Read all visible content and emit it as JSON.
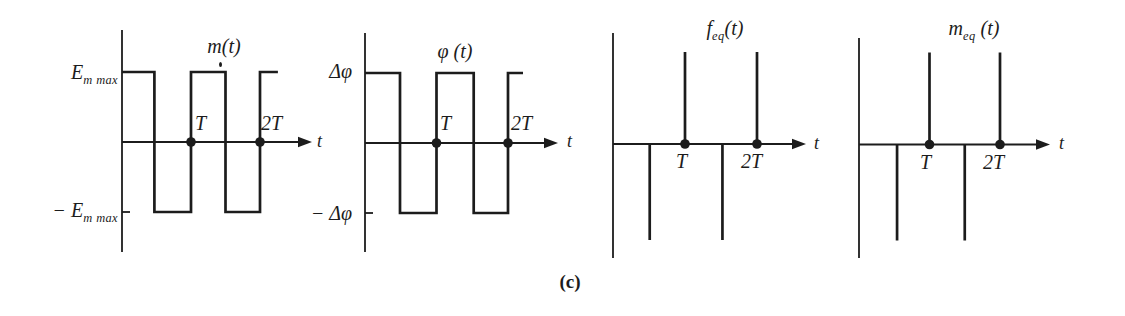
{
  "colors": {
    "ink": "#1c1c1c",
    "paper": "#ffffff"
  },
  "figure": {
    "caption": "(c)"
  },
  "chart_data": [
    {
      "id": "m-plot",
      "type": "line",
      "waveform": "square",
      "title": {
        "pre": "m",
        "sub": "",
        "post": "(t)"
      },
      "xlabel": "t",
      "y_high_label": {
        "pre": "E",
        "sub": "m max",
        "post": ""
      },
      "y_low_label": {
        "pre": "− E",
        "sub": "m max",
        "post": ""
      },
      "x_ticks": [
        "T",
        "2T"
      ],
      "x_in_T": [
        0,
        0.47,
        0.47,
        1,
        1,
        1.5,
        1.5,
        2,
        2,
        2.26
      ],
      "y": [
        1,
        1,
        -1,
        -1,
        1,
        1,
        -1,
        -1,
        1,
        1
      ],
      "dots_at_T": [
        1,
        2
      ]
    },
    {
      "id": "phi-plot",
      "type": "line",
      "waveform": "square",
      "title": {
        "pre": "φ",
        "sub": "",
        "post": " (t)"
      },
      "xlabel": "t",
      "y_high_label": {
        "pre": "Δφ",
        "sub": "",
        "post": ""
      },
      "y_low_label": {
        "pre": "− Δφ",
        "sub": "",
        "post": ""
      },
      "x_ticks": [
        "T",
        "2T"
      ],
      "x_in_T": [
        0,
        0.49,
        0.49,
        1,
        1,
        1.52,
        1.52,
        2,
        2,
        2.21
      ],
      "y": [
        1,
        1,
        -1,
        -1,
        1,
        1,
        -1,
        -1,
        1,
        1
      ],
      "dots_at_T": [
        1,
        2
      ]
    },
    {
      "id": "feq-plot",
      "type": "impulse",
      "title": {
        "pre": "f",
        "sub": "eq",
        "post": "(t)"
      },
      "xlabel": "t",
      "x_ticks": [
        "T",
        "2T"
      ],
      "impulses": [
        {
          "t": 0.51,
          "dir": -1
        },
        {
          "t": 1,
          "dir": 1
        },
        {
          "t": 1.52,
          "dir": -1
        },
        {
          "t": 2,
          "dir": 1
        }
      ],
      "dots_at_T": [
        1,
        2
      ]
    },
    {
      "id": "meq-plot",
      "type": "impulse",
      "title": {
        "pre": "m",
        "sub": "eq",
        "post": " (t)"
      },
      "xlabel": "t",
      "x_ticks": [
        "T",
        "2T"
      ],
      "impulses": [
        {
          "t": 0.54,
          "dir": -1
        },
        {
          "t": 1,
          "dir": 1
        },
        {
          "t": 1.5,
          "dir": -1
        },
        {
          "t": 2,
          "dir": 1
        }
      ],
      "dots_at_T": [
        1,
        2
      ]
    }
  ]
}
